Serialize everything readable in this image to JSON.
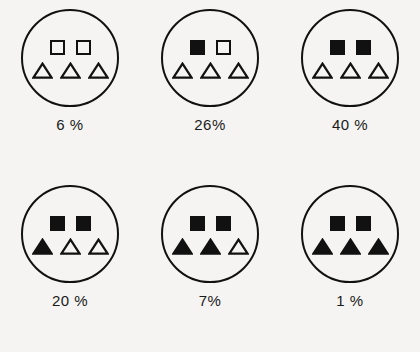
{
  "figure": {
    "name": "shape-fill-proportion-diagram",
    "background_color": "#f5f4f2",
    "ink_color": "#111111",
    "rows": 2,
    "columns": 3
  },
  "chart_data": {
    "type": "table",
    "title": "",
    "xlabel": "",
    "ylabel": "",
    "categories": [
      "6 %",
      "26%",
      "40 %",
      "20 %",
      "7%",
      "1 %"
    ],
    "values": [
      6,
      26,
      40,
      20,
      7,
      1
    ],
    "legend": []
  },
  "items": [
    {
      "id": "item-1",
      "label": "6 %",
      "percent": 6,
      "squares": [
        "empty",
        "empty"
      ],
      "triangles": [
        "empty",
        "empty",
        "empty"
      ],
      "filled_count": 0,
      "total_shapes": 5
    },
    {
      "id": "item-2",
      "label": "26%",
      "percent": 26,
      "squares": [
        "filled",
        "empty"
      ],
      "triangles": [
        "empty",
        "empty",
        "empty"
      ],
      "filled_count": 1,
      "total_shapes": 5
    },
    {
      "id": "item-3",
      "label": "40 %",
      "percent": 40,
      "squares": [
        "filled",
        "filled"
      ],
      "triangles": [
        "empty",
        "empty",
        "empty"
      ],
      "filled_count": 2,
      "total_shapes": 5
    },
    {
      "id": "item-4",
      "label": "20 %",
      "percent": 20,
      "squares": [
        "filled",
        "filled"
      ],
      "triangles": [
        "filled",
        "empty",
        "empty"
      ],
      "filled_count": 3,
      "total_shapes": 5
    },
    {
      "id": "item-5",
      "label": "7%",
      "percent": 7,
      "squares": [
        "filled",
        "filled"
      ],
      "triangles": [
        "filled",
        "filled",
        "empty"
      ],
      "filled_count": 4,
      "total_shapes": 5
    },
    {
      "id": "item-6",
      "label": "1 %",
      "percent": 1,
      "squares": [
        "filled",
        "filled"
      ],
      "triangles": [
        "filled",
        "filled",
        "filled"
      ],
      "filled_count": 5,
      "total_shapes": 5
    }
  ]
}
